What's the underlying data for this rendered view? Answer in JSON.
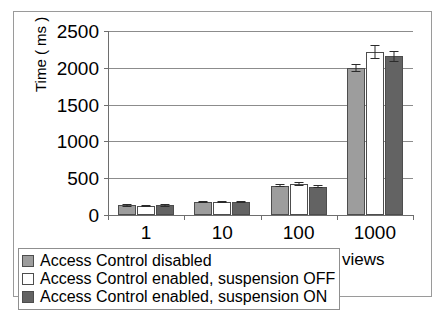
{
  "chart_data": {
    "type": "bar",
    "title": "",
    "subtitle": "",
    "xlabel": "Number of views",
    "ylabel": "Time ( ms )",
    "categories": [
      "1",
      "10",
      "100",
      "1000"
    ],
    "ylim": [
      0,
      2500
    ],
    "yticks": [
      0,
      500,
      1000,
      1500,
      2000,
      2500
    ],
    "ytick_labels": [
      "0",
      "500",
      "1000",
      "1500",
      "2000",
      "2500"
    ],
    "grid": "horizontal",
    "legend_position": "bottom-left",
    "series": [
      {
        "name": "Access Control disabled",
        "color": "#9d9d9d",
        "values": [
          130,
          180,
          400,
          2000
        ],
        "errors": [
          15,
          15,
          20,
          55
        ]
      },
      {
        "name": "Access Control enabled, suspension OFF",
        "color": "#ffffff",
        "values": [
          125,
          175,
          420,
          2215
        ],
        "errors": [
          15,
          15,
          25,
          100
        ]
      },
      {
        "name": "Access Control enabled, suspension ON",
        "color": "#636363",
        "values": [
          130,
          175,
          385,
          2160
        ],
        "errors": [
          15,
          15,
          20,
          75
        ]
      }
    ]
  }
}
